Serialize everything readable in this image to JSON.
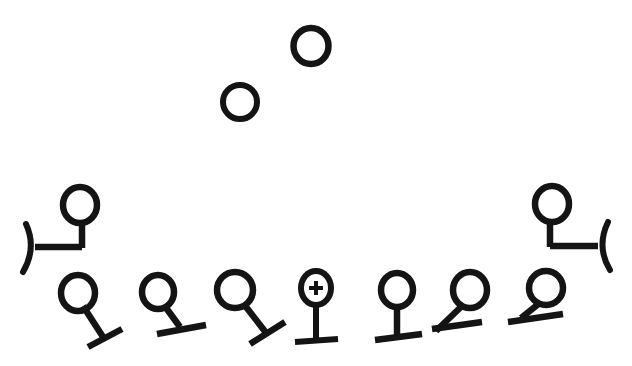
{
  "image": {
    "title": "Hand-drawn symbol diagram",
    "width": 632,
    "height": 366,
    "background_color": "#ffffff",
    "ink_color": "#141414",
    "description": "Arc-shaped arrangement of open-circle symbols; two plain circles float above, two bracketed stem symbols at the outer ends, and a row of seven stemmed circle symbols along the bottom."
  },
  "groups": {
    "floating": {
      "label": "floating plain circles",
      "count": 2
    },
    "outer": {
      "label": "bracketed stem symbols",
      "count": 2
    },
    "bottom_row": {
      "label": "stemmed circle symbols",
      "count": 7
    }
  },
  "symbols": [
    {
      "id": "floating-circle-left",
      "group": "floating",
      "kind": "plain-circle",
      "cx": 240,
      "cy": 102,
      "rx": 17,
      "ry": 17,
      "stroke_width": 6,
      "has_plus": false,
      "stem": null,
      "bar": null,
      "arc": null
    },
    {
      "id": "floating-circle-right",
      "group": "floating",
      "kind": "plain-circle",
      "cx": 311,
      "cy": 46,
      "rx": 17.5,
      "ry": 18,
      "stroke_width": 6.5,
      "has_plus": false,
      "stem": null,
      "bar": null,
      "arc": null
    },
    {
      "id": "outer-left-bracket-symbol",
      "group": "outer",
      "kind": "stem-with-left-bracket",
      "cx": 80,
      "cy": 205,
      "rx": 17,
      "ry": 18,
      "stroke_width": 6.5,
      "has_plus": false,
      "stem": {
        "x1": 82,
        "y1": 223,
        "x2": 82,
        "y2": 248
      },
      "bar": {
        "x1": 82,
        "y1": 247,
        "x2": 35,
        "y2": 247
      },
      "arc": {
        "d": "M 26 224 Q 37 248 23 272",
        "stroke_width": 6
      }
    },
    {
      "id": "outer-right-bracket-symbol",
      "group": "outer",
      "kind": "stem-with-right-bracket",
      "cx": 552,
      "cy": 204,
      "rx": 17,
      "ry": 18,
      "stroke_width": 6.5,
      "has_plus": false,
      "stem": {
        "x1": 550,
        "y1": 222,
        "x2": 550,
        "y2": 247
      },
      "bar": {
        "x1": 550,
        "y1": 246,
        "x2": 598,
        "y2": 246
      },
      "arc": {
        "d": "M 608 222 Q 596 247 610 270",
        "stroke_width": 6
      }
    },
    {
      "id": "row-symbol-1",
      "group": "bottom_row",
      "index": 1,
      "kind": "stem-down-right-tilted-bar",
      "cx": 78,
      "cy": 293,
      "rx": 17,
      "ry": 18,
      "stroke_width": 6.5,
      "has_plus": false,
      "stem": {
        "x1": 83,
        "y1": 306,
        "x2": 105,
        "y2": 340
      },
      "bar": {
        "x1": 88,
        "y1": 347,
        "x2": 122,
        "y2": 329
      },
      "arc": null
    },
    {
      "id": "row-symbol-2",
      "group": "bottom_row",
      "index": 2,
      "kind": "stem-down-right-flat-bar",
      "cx": 158,
      "cy": 292,
      "rx": 16,
      "ry": 17,
      "stroke_width": 6.5,
      "has_plus": false,
      "stem": {
        "x1": 164,
        "y1": 305,
        "x2": 180,
        "y2": 327
      },
      "bar": {
        "x1": 157,
        "y1": 334,
        "x2": 206,
        "y2": 325
      },
      "arc": null
    },
    {
      "id": "row-symbol-3",
      "group": "bottom_row",
      "index": 3,
      "kind": "stem-down-right-tilted-bar",
      "cx": 235,
      "cy": 290,
      "rx": 18,
      "ry": 18,
      "stroke_width": 6.5,
      "has_plus": false,
      "stem": {
        "x1": 243,
        "y1": 303,
        "x2": 267,
        "y2": 334
      },
      "bar": {
        "x1": 250,
        "y1": 344,
        "x2": 285,
        "y2": 322
      },
      "arc": null
    },
    {
      "id": "row-symbol-4",
      "group": "bottom_row",
      "index": 4,
      "kind": "plus-circle-vertical-stem",
      "cx": 316,
      "cy": 288,
      "rx": 15,
      "ry": 17,
      "stroke_width": 6,
      "has_plus": true,
      "plus": {
        "cx": 316,
        "cy": 288,
        "size": 14,
        "stroke_width": 4
      },
      "stem": {
        "x1": 316,
        "y1": 305,
        "x2": 316,
        "y2": 341
      },
      "bar": {
        "x1": 295,
        "y1": 342,
        "x2": 338,
        "y2": 339
      },
      "arc": null
    },
    {
      "id": "row-symbol-5",
      "group": "bottom_row",
      "index": 5,
      "kind": "vertical-stem-flat-bar",
      "cx": 397,
      "cy": 290,
      "rx": 16,
      "ry": 17,
      "stroke_width": 6.5,
      "has_plus": false,
      "stem": {
        "x1": 397,
        "y1": 307,
        "x2": 397,
        "y2": 336
      },
      "bar": {
        "x1": 375,
        "y1": 340,
        "x2": 422,
        "y2": 334
      },
      "arc": null
    },
    {
      "id": "row-symbol-6",
      "group": "bottom_row",
      "index": 6,
      "kind": "stem-down-left-bar",
      "cx": 470,
      "cy": 290,
      "rx": 17,
      "ry": 18,
      "stroke_width": 6.5,
      "has_plus": false,
      "stem": {
        "x1": 464,
        "y1": 304,
        "x2": 436,
        "y2": 331
      },
      "bar": {
        "x1": 432,
        "y1": 329,
        "x2": 482,
        "y2": 322
      },
      "arc": null
    },
    {
      "id": "row-symbol-7",
      "group": "bottom_row",
      "index": 7,
      "kind": "stem-down-left-bar",
      "cx": 546,
      "cy": 288,
      "rx": 17,
      "ry": 17,
      "stroke_width": 6.5,
      "has_plus": false,
      "stem": {
        "x1": 541,
        "y1": 302,
        "x2": 521,
        "y2": 318
      },
      "bar": {
        "x1": 508,
        "y1": 322,
        "x2": 563,
        "y2": 314
      },
      "arc": null
    }
  ]
}
